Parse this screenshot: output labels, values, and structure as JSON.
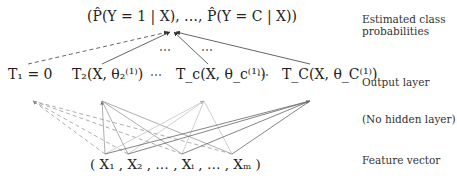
{
  "top": {
    "estimate": "(P̂(Y = 1 | X), …, P̂(Y = C | X))"
  },
  "output_nodes": [
    {
      "label": "T₁ = 0"
    },
    {
      "label": "T₂(X, θ₂⁽¹⁾)"
    },
    {
      "label": "T_c(X, θ_c⁽¹⁾)"
    },
    {
      "label": "T_C(X, θ_C⁽¹⁾)"
    }
  ],
  "output_dots": [
    "⋯",
    "⋯"
  ],
  "mid_dots": [
    "⋯",
    "⋯"
  ],
  "feature_vector": "( X₁ , X₂ , … , Xᵢ , … , Xₘ )",
  "side_labels": {
    "estimated_line1": "Estimated class",
    "estimated_line2": "probabilities",
    "output_layer": "Output layer",
    "hidden_layer": "(No hidden layer)",
    "feature_vector": "Feature vector"
  },
  "colors": {
    "dark_line": "#555555",
    "mid_line": "#888888",
    "light_line": "#bbbbbb",
    "dashed_line": "#888888"
  }
}
